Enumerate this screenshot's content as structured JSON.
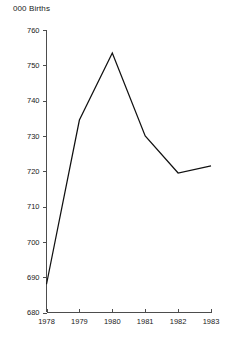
{
  "chart_data": {
    "type": "line",
    "title": "000 Births",
    "xlabel": "",
    "ylabel": "",
    "x": [
      1978,
      1979,
      1980,
      1981,
      1982,
      1983
    ],
    "categories": [
      "1978",
      "1979",
      "1980",
      "1981",
      "1982",
      "1983"
    ],
    "values": [
      688.0,
      734.5,
      753.5,
      730.0,
      719.5,
      721.5
    ],
    "series": [
      {
        "name": "Births",
        "values": [
          688.0,
          734.5,
          753.5,
          730.0,
          719.5,
          721.5
        ]
      }
    ],
    "ylim": [
      680,
      760
    ],
    "xlim": [
      1978,
      1983
    ],
    "yticks": [
      680,
      690,
      700,
      710,
      720,
      730,
      740,
      750,
      760
    ],
    "ytick_labels": [
      "680",
      "690",
      "700",
      "710",
      "720",
      "730",
      "740",
      "750",
      "760"
    ],
    "xticks": [
      1978,
      1979,
      1980,
      1981,
      1982,
      1983
    ],
    "xtick_labels": [
      "1978",
      "1979",
      "1980",
      "1981",
      "1982",
      "1983"
    ],
    "grid": false,
    "legend": false,
    "legend_position": "none",
    "line_color": "#111111",
    "axis_color": "#4d4d4d",
    "background_color": "#ffffff",
    "annotations": []
  },
  "axis_title": "000 Births"
}
